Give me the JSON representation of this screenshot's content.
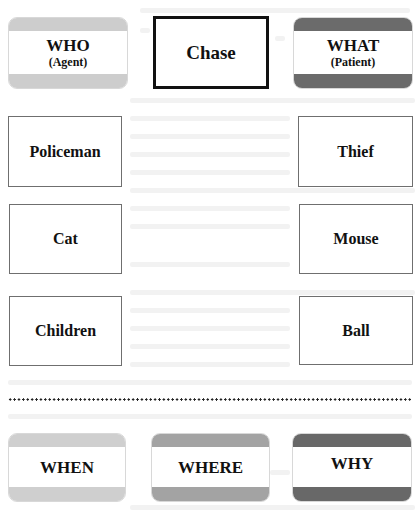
{
  "roles": {
    "who": {
      "label": "WHO",
      "sub": "(Agent)",
      "band_color": "#cdcdcd"
    },
    "what": {
      "label": "WHAT",
      "sub": "(Patient)",
      "band_color": "#6b6b6b"
    }
  },
  "verb": {
    "label": "Chase"
  },
  "pairs": [
    {
      "agent": "Policeman",
      "patient": "Thief"
    },
    {
      "agent": "Cat",
      "patient": "Mouse"
    },
    {
      "agent": "Children",
      "patient": "Ball"
    }
  ],
  "adjuncts": [
    {
      "label": "WHEN",
      "band_color": "#cfcfcf"
    },
    {
      "label": "WHERE",
      "band_color": "#a3a3a3"
    },
    {
      "label": "WHY",
      "band_color": "#686868"
    }
  ],
  "colors": {
    "light_band": "#cdcdcd",
    "medium_band": "#a3a3a3",
    "dark_band": "#6b6b6b",
    "verb_border": "#111111",
    "arg_border": "#6f6f6f"
  }
}
